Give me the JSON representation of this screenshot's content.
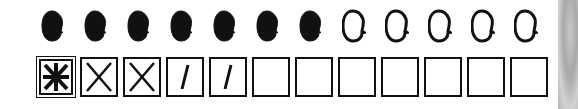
{
  "tracker": {
    "heads": [
      {
        "state": "filled"
      },
      {
        "state": "filled"
      },
      {
        "state": "filled"
      },
      {
        "state": "filled"
      },
      {
        "state": "filled"
      },
      {
        "state": "filled"
      },
      {
        "state": "filled"
      },
      {
        "state": "empty"
      },
      {
        "state": "empty"
      },
      {
        "state": "empty"
      },
      {
        "state": "empty"
      },
      {
        "state": "empty"
      }
    ],
    "boxes": [
      {
        "mark": "asterisk",
        "symbol": "✱"
      },
      {
        "mark": "x",
        "symbol": "X"
      },
      {
        "mark": "x",
        "symbol": "X"
      },
      {
        "mark": "slash",
        "symbol": "/"
      },
      {
        "mark": "slash",
        "symbol": "/"
      },
      {
        "mark": "none",
        "symbol": ""
      },
      {
        "mark": "none",
        "symbol": ""
      },
      {
        "mark": "none",
        "symbol": ""
      },
      {
        "mark": "none",
        "symbol": ""
      },
      {
        "mark": "none",
        "symbol": ""
      },
      {
        "mark": "none",
        "symbol": ""
      },
      {
        "mark": "none",
        "symbol": ""
      }
    ],
    "colors": {
      "ink": "#111111",
      "paper": "#ffffff",
      "edge": "#b8b8b8"
    }
  }
}
